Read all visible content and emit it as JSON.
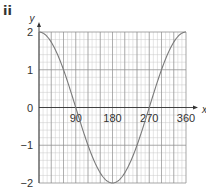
{
  "part_label": "ii",
  "chart_data": {
    "type": "line",
    "title": "",
    "xlabel": "x",
    "ylabel": "y",
    "xlim": [
      0,
      360
    ],
    "ylim": [
      -2,
      2
    ],
    "x_ticks": [
      90,
      180,
      270,
      360
    ],
    "x_tick_labels": [
      "90",
      "180",
      "270",
      "360"
    ],
    "y_ticks": [
      -2,
      -1,
      0,
      1,
      2
    ],
    "y_tick_labels": [
      "−2",
      "−1",
      "0",
      "1",
      "2"
    ],
    "grid": true,
    "series": [
      {
        "name": "y = 2cos x",
        "x": [
          0,
          30,
          60,
          90,
          120,
          150,
          180,
          210,
          240,
          270,
          300,
          330,
          360
        ],
        "values": [
          2,
          1.73,
          1,
          0,
          -1,
          -1.73,
          -2,
          -1.73,
          -1,
          0,
          1,
          1.73,
          2
        ]
      }
    ]
  },
  "colors": {
    "curve": "#7a7a7a",
    "major_grid": "#8c8c8c",
    "minor_grid": "#c8c8c8",
    "axis": "#333333",
    "text": "#333333"
  }
}
